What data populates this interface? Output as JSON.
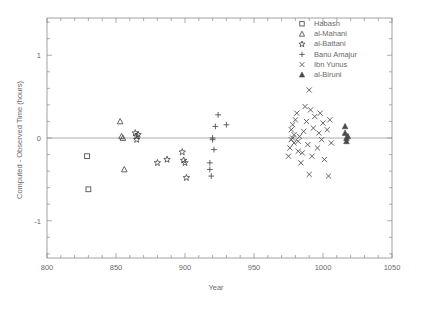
{
  "chart_data": {
    "type": "scatter",
    "title": "",
    "xlabel": "Year",
    "ylabel": "Computed - Observed Time (hours)",
    "xlim": [
      800,
      1050
    ],
    "ylim": [
      -1.45,
      1.45
    ],
    "xticks": [
      800,
      850,
      900,
      950,
      1000,
      1050
    ],
    "xtick_labels": [
      "800",
      "850",
      "900",
      "950",
      "1000",
      "1050"
    ],
    "yticks": [
      1,
      0,
      -1
    ],
    "ytick_labels": [
      "1",
      "0",
      "-1"
    ],
    "x_minor_tick_step": 10,
    "y_minor_tick_step": 0.2,
    "grid": false,
    "zero_reference_line": 0,
    "legend_position": "top-right",
    "series": [
      {
        "name": "Habash",
        "marker": "open-square",
        "points": [
          {
            "x": 829,
            "y": -0.22
          },
          {
            "x": 830,
            "y": -0.62
          }
        ]
      },
      {
        "name": "al-Mahani",
        "marker": "open-triangle",
        "points": [
          {
            "x": 853,
            "y": 0.2
          },
          {
            "x": 854,
            "y": 0.02
          },
          {
            "x": 855,
            "y": 0.0
          },
          {
            "x": 856,
            "y": -0.38
          }
        ]
      },
      {
        "name": "al-Battani",
        "marker": "open-star",
        "points": [
          {
            "x": 864,
            "y": 0.06
          },
          {
            "x": 865,
            "y": 0.02
          },
          {
            "x": 865,
            "y": -0.02
          },
          {
            "x": 866,
            "y": 0.04
          },
          {
            "x": 880,
            "y": -0.3
          },
          {
            "x": 887,
            "y": -0.26
          },
          {
            "x": 898,
            "y": -0.17
          },
          {
            "x": 899,
            "y": -0.27
          },
          {
            "x": 900,
            "y": -0.3
          },
          {
            "x": 901,
            "y": -0.48
          }
        ]
      },
      {
        "name": "Banu Amajur",
        "marker": "plus",
        "points": [
          {
            "x": 918,
            "y": -0.3
          },
          {
            "x": 918,
            "y": -0.38
          },
          {
            "x": 919,
            "y": -0.46
          },
          {
            "x": 920,
            "y": -0.02
          },
          {
            "x": 920,
            "y": 0.0
          },
          {
            "x": 921,
            "y": -0.14
          },
          {
            "x": 922,
            "y": 0.14
          },
          {
            "x": 924,
            "y": 0.28
          },
          {
            "x": 930,
            "y": 0.16
          }
        ]
      },
      {
        "name": "Ibn Yunus",
        "marker": "cross",
        "points": [
          {
            "x": 975,
            "y": -0.22
          },
          {
            "x": 976,
            "y": -0.12
          },
          {
            "x": 977,
            "y": -0.02
          },
          {
            "x": 977,
            "y": 0.1
          },
          {
            "x": 978,
            "y": 0.0
          },
          {
            "x": 978,
            "y": 0.16
          },
          {
            "x": 979,
            "y": 0.04
          },
          {
            "x": 979,
            "y": -0.06
          },
          {
            "x": 980,
            "y": 0.22
          },
          {
            "x": 981,
            "y": 0.3
          },
          {
            "x": 982,
            "y": -0.04
          },
          {
            "x": 982,
            "y": -0.16
          },
          {
            "x": 983,
            "y": 0.02
          },
          {
            "x": 984,
            "y": -0.3
          },
          {
            "x": 985,
            "y": -0.18
          },
          {
            "x": 986,
            "y": 0.08
          },
          {
            "x": 987,
            "y": 0.38
          },
          {
            "x": 988,
            "y": 0.2
          },
          {
            "x": 989,
            "y": -0.08
          },
          {
            "x": 990,
            "y": 0.58
          },
          {
            "x": 990,
            "y": -0.44
          },
          {
            "x": 991,
            "y": 0.34
          },
          {
            "x": 992,
            "y": -0.22
          },
          {
            "x": 993,
            "y": 0.12
          },
          {
            "x": 994,
            "y": 0.26
          },
          {
            "x": 996,
            "y": -0.12
          },
          {
            "x": 997,
            "y": 0.06
          },
          {
            "x": 998,
            "y": 0.3
          },
          {
            "x": 999,
            "y": -0.02
          },
          {
            "x": 1000,
            "y": 0.18
          },
          {
            "x": 1001,
            "y": -0.26
          },
          {
            "x": 1003,
            "y": 0.1
          },
          {
            "x": 1004,
            "y": -0.46
          },
          {
            "x": 1005,
            "y": 0.22
          },
          {
            "x": 1006,
            "y": -0.06
          }
        ]
      },
      {
        "name": "al-Biruni",
        "marker": "filled-triangle",
        "points": [
          {
            "x": 1016,
            "y": 0.14
          },
          {
            "x": 1016,
            "y": 0.06
          },
          {
            "x": 1017,
            "y": 0.0
          },
          {
            "x": 1017,
            "y": -0.04
          },
          {
            "x": 1018,
            "y": 0.02
          }
        ]
      }
    ]
  },
  "legend": {
    "entries": [
      {
        "label": "Habash",
        "marker": "open-square"
      },
      {
        "label": "al-Mahani",
        "marker": "open-triangle"
      },
      {
        "label": "al-Battani",
        "marker": "open-star"
      },
      {
        "label": "Banu Amajur",
        "marker": "plus"
      },
      {
        "label": "Ibn Yunus",
        "marker": "cross"
      },
      {
        "label": "al-Biruni",
        "marker": "filled-triangle"
      }
    ]
  },
  "colors": {
    "background": "#ffffff",
    "axis": "#8a8a8a",
    "marker": "#4a4a4a",
    "text": "#6a6a6a"
  }
}
